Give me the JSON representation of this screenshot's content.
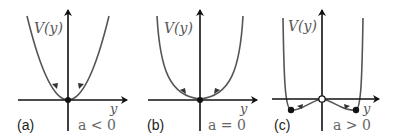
{
  "figure": {
    "axis_color": "#111111",
    "curve_color": "#555555",
    "panels": [
      {
        "id": "a",
        "panel_label": "(a)",
        "y_axis_label": "V(y)",
        "x_axis_label": "y",
        "condition": "a < 0",
        "shape": "parabola (V ~ y^2), single stable minimum at origin",
        "fixed_points": [
          {
            "y": 0,
            "type": "stable",
            "marker": "filled"
          }
        ]
      },
      {
        "id": "b",
        "panel_label": "(b)",
        "y_axis_label": "V(y)",
        "x_axis_label": "y",
        "condition": "a = 0",
        "shape": "quartic (V ~ y^4), flat-bottomed minimum at origin",
        "fixed_points": [
          {
            "y": 0,
            "type": "stable",
            "marker": "filled"
          }
        ]
      },
      {
        "id": "c",
        "panel_label": "(c)",
        "y_axis_label": "V(y)",
        "x_axis_label": "y",
        "condition": "a > 0",
        "shape": "double well, local maximum at origin, two minima",
        "fixed_points": [
          {
            "y": "-y*",
            "type": "stable",
            "marker": "filled"
          },
          {
            "y": 0,
            "type": "unstable",
            "marker": "open"
          },
          {
            "y": "+y*",
            "type": "stable",
            "marker": "filled"
          }
        ]
      }
    ]
  }
}
